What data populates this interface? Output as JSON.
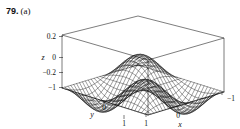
{
  "figure": {
    "number": "79.",
    "part": "(a)"
  },
  "chart_data": {
    "type": "surface3d",
    "title": "",
    "xlabel": "x",
    "ylabel": "y",
    "zlabel": "z",
    "function": "z = sin(pi*x)*sin(pi*y)/3 style oscillating saddle mesh",
    "xlim": [
      1,
      -1
    ],
    "ylim": [
      -1,
      1
    ],
    "zlim": [
      -0.35,
      0.35
    ],
    "xticks": [
      "1",
      "0",
      "-1"
    ],
    "yticks": [
      "-1",
      "0",
      "1"
    ],
    "zticks": [
      "0.2",
      "0",
      "-0.2",
      "-1"
    ],
    "grid": true,
    "legend": false,
    "mesh_u_lines": 26,
    "mesh_v_lines": 26,
    "line_color": "#000000",
    "box_color": "#000000",
    "background": "#ffffff"
  },
  "axes": {
    "z": {
      "name": "z",
      "ticks": [
        {
          "label": "0.2"
        },
        {
          "label": "0"
        },
        {
          "label": "−0.2"
        },
        {
          "label": "−1"
        }
      ]
    },
    "y": {
      "name": "y",
      "ticks": [
        {
          "label": "0"
        },
        {
          "label": "1"
        }
      ]
    },
    "x": {
      "name": "x",
      "ticks": [
        {
          "label": "1"
        },
        {
          "label": "0"
        },
        {
          "label": "−1"
        }
      ]
    }
  }
}
